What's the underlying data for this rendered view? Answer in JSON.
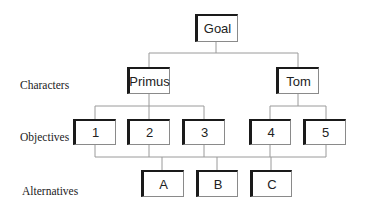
{
  "diagram": {
    "type": "hierarchy",
    "levels": [
      {
        "label": ""
      },
      {
        "label": "Characters"
      },
      {
        "label": "Objectives"
      },
      {
        "label": "Alternatives"
      }
    ],
    "nodes": {
      "goal": {
        "label": "Goal"
      },
      "primus": {
        "label": "Primus"
      },
      "tom": {
        "label": "Tom"
      },
      "obj1": {
        "label": "1"
      },
      "obj2": {
        "label": "2"
      },
      "obj3": {
        "label": "3"
      },
      "obj4": {
        "label": "4"
      },
      "obj5": {
        "label": "5"
      },
      "altA": {
        "label": "A"
      },
      "altB": {
        "label": "B"
      },
      "altC": {
        "label": "C"
      }
    },
    "edges": [
      [
        "Goal",
        "Primus"
      ],
      [
        "Goal",
        "Tom"
      ],
      [
        "Primus",
        "1"
      ],
      [
        "Primus",
        "2"
      ],
      [
        "Primus",
        "3"
      ],
      [
        "Tom",
        "4"
      ],
      [
        "Tom",
        "5"
      ],
      [
        "1",
        "A"
      ],
      [
        "2",
        "A"
      ],
      [
        "3",
        "A"
      ],
      [
        "4",
        "A"
      ],
      [
        "5",
        "A"
      ],
      [
        "1",
        "B"
      ],
      [
        "2",
        "B"
      ],
      [
        "3",
        "B"
      ],
      [
        "4",
        "B"
      ],
      [
        "5",
        "B"
      ],
      [
        "1",
        "C"
      ],
      [
        "2",
        "C"
      ],
      [
        "3",
        "C"
      ],
      [
        "4",
        "C"
      ],
      [
        "5",
        "C"
      ]
    ]
  },
  "row_labels": {
    "characters": "Characters",
    "objectives": "Objectives",
    "alternatives": "Alternatives"
  }
}
